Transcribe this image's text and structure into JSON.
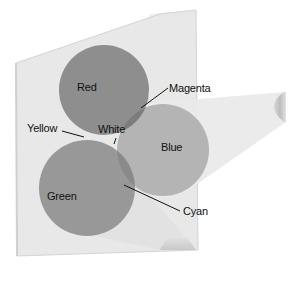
{
  "diagram": {
    "type": "additive-color-mixing",
    "labels": {
      "red": "Red",
      "green": "Green",
      "blue": "Blue",
      "yellow": "Yellow",
      "magenta": "Magenta",
      "cyan": "Cyan",
      "white": "White"
    },
    "colors": {
      "background": "#ffffff",
      "screen": "#e6e6e6",
      "screen_edge": "#cfcfcf",
      "beam": "#ececec",
      "red": "#8e8e8e",
      "green": "#989898",
      "blue": "#b4b4b4",
      "magenta": "#7c7c7c",
      "cyan": "#8a8a8a",
      "yellow": "#dcdcdc",
      "white": "#f4f4f4",
      "leader_line": "#111111",
      "text": "#111111"
    }
  }
}
